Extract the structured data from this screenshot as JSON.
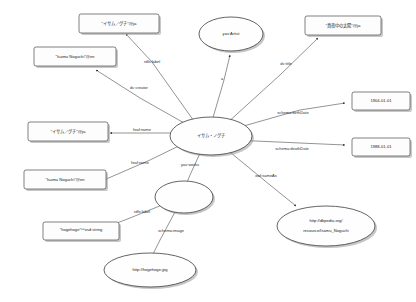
{
  "diagram": {
    "type": "rdf-graph",
    "background_color": "#ffffff",
    "node_fill": "#fdfdfd",
    "node_stroke": "#4a4a4a",
    "edge_color": "#3a3a3a"
  },
  "nodes": {
    "label_ja_top": {
      "text": "\"イサム／グチ\"@ja",
      "shape": "rect"
    },
    "label_en_upper": {
      "text": "\"Isamu Noguchi\"@en",
      "shape": "rect"
    },
    "name_ja": {
      "text": "\"イサム／グチ\"@ja",
      "shape": "rect"
    },
    "name_en": {
      "text": "\"Isamu Noguchi\"@en",
      "shape": "rect"
    },
    "type_artist": {
      "text": "yav:Artist",
      "shape": "ellipse"
    },
    "work_title_ja": {
      "text": "\"真夜中の太陽\"@ja",
      "shape": "rect"
    },
    "birth_date": {
      "text": "1904-01-01",
      "shape": "rect"
    },
    "death_date": {
      "text": "1988-01-01",
      "shape": "rect"
    },
    "center": {
      "text": "イサム・ノグチ",
      "shape": "ellipse"
    },
    "dbpedia": {
      "line1": "http://dbpedia.org/",
      "line2": "resource/Isamu_Noguchi",
      "shape": "ellipse"
    },
    "work_blank": {
      "text": "",
      "shape": "ellipse"
    },
    "image_label": {
      "text": "\"hogehoge\"^^xsd:string",
      "shape": "rect"
    },
    "image_url": {
      "text": "http://hogehoge.jpg",
      "shape": "ellipse"
    }
  },
  "edges": {
    "rdfs_label_top": "rdfs:label",
    "dc_creator": "dc:creator",
    "foaf_name_1": "foaf:name",
    "foaf_name_2": "foaf:name",
    "rdf_type": "a",
    "dc_title": "dc:title",
    "schema_birth_date": "schema:birthDate",
    "schema_death_date": "schema:deathDate",
    "owl_same_as": "owl:sameAs",
    "yav_works": "yav:works",
    "rdfs_label_image": "rdfs:label",
    "schema_image": "schema:image"
  }
}
